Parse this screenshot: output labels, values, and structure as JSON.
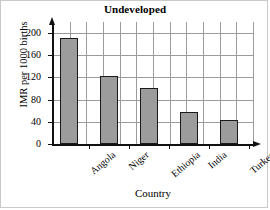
{
  "chart_data": {
    "type": "bar",
    "title": "Undeveloped",
    "xlabel": "Country",
    "ylabel": "IMR per 1000 births",
    "categories": [
      "Angola",
      "Niger",
      "Ethiopia",
      "India",
      "Turkey"
    ],
    "values": [
      192,
      122,
      101,
      57,
      43
    ],
    "ylim": [
      0,
      220
    ],
    "yticks": [
      0,
      40,
      80,
      120,
      160,
      200
    ],
    "ytick_labels": [
      "0",
      "40",
      "80",
      "120",
      "160",
      "200"
    ],
    "grid": true,
    "legend": "none",
    "bar_fill_color": "#9c9c9c",
    "bar_edge_color": "#1a1a1a",
    "grid_color": "#9b9b9b",
    "axis_color": "#111111"
  }
}
